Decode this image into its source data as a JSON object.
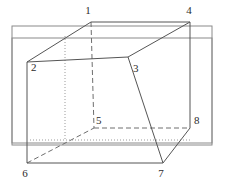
{
  "figure": {
    "name": "cube-net-diagram",
    "width": 225,
    "height": 182,
    "background_color": "#ffffff",
    "line_color": "#555555",
    "label_color": "#2b2b2b",
    "solid_stroke_width": 1,
    "dashed_pattern": "5,3",
    "dotted_pattern": "1,2",
    "vertices": [
      {
        "id": "1",
        "label": "1",
        "x": 91,
        "y": 22,
        "label_x": 88,
        "label_y": 14
      },
      {
        "id": "2",
        "label": "2",
        "x": 27,
        "y": 62,
        "label_x": 31,
        "label_y": 71
      },
      {
        "id": "3",
        "label": "3",
        "x": 128,
        "y": 57,
        "label_x": 133,
        "label_y": 72
      },
      {
        "id": "4",
        "label": "4",
        "x": 190,
        "y": 22,
        "label_x": 186,
        "label_y": 14
      },
      {
        "id": "5",
        "label": "5",
        "x": 94,
        "y": 128,
        "label_x": 96,
        "label_y": 124
      },
      {
        "id": "6",
        "label": "6",
        "x": 27,
        "y": 163,
        "label_x": 24,
        "label_y": 177
      },
      {
        "id": "7",
        "label": "7",
        "x": 163,
        "y": 163,
        "label_x": 159,
        "label_y": 177
      },
      {
        "id": "8",
        "label": "8",
        "x": 190,
        "y": 128,
        "label_x": 194,
        "label_y": 124
      }
    ],
    "background_rectangles": [
      {
        "name": "rear-rectangle",
        "x": 12,
        "y": 26,
        "width": 200,
        "height": 117
      },
      {
        "name": "front-rectangle",
        "x": 12,
        "y": 38,
        "width": 200,
        "height": 107
      }
    ],
    "solid_edges": [
      {
        "name": "edge-1-4",
        "from": "1",
        "to": "4"
      },
      {
        "name": "edge-2-1",
        "from": "2",
        "to": "1"
      },
      {
        "name": "edge-3-4",
        "from": "3",
        "to": "4"
      },
      {
        "name": "edge-2-3",
        "from": "2",
        "to": "3"
      },
      {
        "name": "edge-2-6",
        "from": "2",
        "to": "6"
      },
      {
        "name": "edge-3-7",
        "from": "3",
        "to": "7"
      },
      {
        "name": "edge-4-8",
        "from": "4",
        "to": "8"
      },
      {
        "name": "edge-6-7",
        "from": "6",
        "to": "7"
      },
      {
        "name": "edge-7-8",
        "from": "7",
        "to": "8"
      }
    ],
    "dashed_edges": [
      {
        "name": "edge-1-5",
        "from": "1",
        "to": "5"
      },
      {
        "name": "edge-5-8",
        "from": "5",
        "to": "8"
      },
      {
        "name": "edge-6-5",
        "from": "6",
        "to": "5"
      }
    ],
    "dotted_edges": [
      {
        "name": "edge-hidden-vertical",
        "x1": 65,
        "y1": 36,
        "x2": 65,
        "y2": 140
      },
      {
        "name": "edge-hidden-base",
        "x1": 30,
        "y1": 140,
        "x2": 190,
        "y2": 140
      }
    ]
  }
}
